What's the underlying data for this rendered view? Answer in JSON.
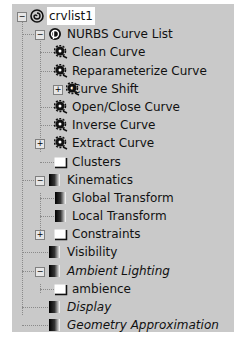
{
  "tree": {
    "root": {
      "label": "crvlist1",
      "icon": "spiral-icon",
      "expanded": true,
      "selected": true
    },
    "nodes": [
      {
        "label": "NURBS Curve List",
        "icon": "nurbs-curve-list-icon",
        "level": 1,
        "expander": "minus",
        "italic": false
      },
      {
        "label": "Clean Curve",
        "icon": "operator-gear-icon",
        "level": 2,
        "expander": null,
        "italic": false
      },
      {
        "label": "Reparameterize Curve",
        "icon": "operator-gear-icon",
        "level": 2,
        "expander": null,
        "italic": false
      },
      {
        "label": "Curve Shift",
        "icon": "operator-gear-icon",
        "level": 2,
        "expander": "plus",
        "italic": false
      },
      {
        "label": "Open/Close Curve",
        "icon": "operator-gear-icon",
        "level": 2,
        "expander": null,
        "italic": false
      },
      {
        "label": "Inverse Curve",
        "icon": "operator-gear-icon",
        "level": 2,
        "expander": null,
        "italic": false
      },
      {
        "label": "Extract Curve",
        "icon": "operator-gear-icon",
        "level": 2,
        "expander": "plus",
        "italic": false
      },
      {
        "label": "Clusters",
        "icon": "folder-icon",
        "level": 2,
        "expander": null,
        "italic": false
      },
      {
        "label": "Kinematics",
        "icon": "property-icon",
        "level": 1,
        "expander": "minus",
        "italic": false
      },
      {
        "label": "Global Transform",
        "icon": "property-icon",
        "level": 2,
        "expander": null,
        "italic": false
      },
      {
        "label": "Local Transform",
        "icon": "property-icon",
        "level": 2,
        "expander": null,
        "italic": false
      },
      {
        "label": "Constraints",
        "icon": "folder-icon",
        "level": 2,
        "expander": "plus",
        "italic": false
      },
      {
        "label": "Visibility",
        "icon": "property-icon",
        "level": 1,
        "expander": null,
        "italic": false
      },
      {
        "label": "Ambient Lighting",
        "icon": "property-icon",
        "level": 1,
        "expander": "minus",
        "italic": true
      },
      {
        "label": "ambience",
        "icon": "folder-icon",
        "level": 2,
        "expander": null,
        "italic": false
      },
      {
        "label": "Display",
        "icon": "property-icon",
        "level": 1,
        "expander": null,
        "italic": true
      },
      {
        "label": "Geometry Approximation",
        "icon": "property-icon",
        "level": 1,
        "expander": null,
        "italic": true
      }
    ]
  },
  "colors": {
    "panel_bg": "#c9c9c9",
    "selection_bg": "#ffffff",
    "text": "#111111"
  }
}
